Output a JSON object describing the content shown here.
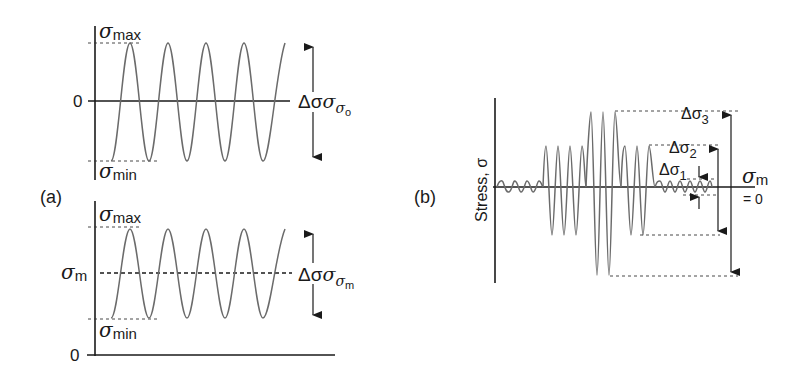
{
  "figure": {
    "panel_a": {
      "label": "(a)",
      "top": {
        "sigma": "σ",
        "max_sub": "max",
        "min_sub": "min",
        "zero_label": "0",
        "range_delta": "Δσ",
        "range_sub_sigma": "σ",
        "range_sub_sub": "o",
        "description": "Fully reversed cycle about zero"
      },
      "bottom": {
        "sigma": "σ",
        "max_sub": "max",
        "min_sub": "min",
        "mean_sub": "m",
        "zero_label": "0",
        "range_delta": "Δσ",
        "range_sub_sigma": "σ",
        "range_sub_sub": "m",
        "description": "Cycle about nonzero mean stress"
      }
    },
    "panel_b": {
      "label": "(b)",
      "y_axis_label": "Stress, σ",
      "mean_sigma": "σ",
      "mean_sub": "m",
      "mean_value": "= 0",
      "ranges": [
        {
          "delta": "Δσ",
          "sub": "1"
        },
        {
          "delta": "Δσ",
          "sub": "2"
        },
        {
          "delta": "Δσ",
          "sub": "3"
        }
      ],
      "description": "Variable amplitude loading blocks"
    }
  },
  "colors": {
    "axis": "#1a1a1a",
    "wave": "#6b6b6b",
    "background": "#ffffff"
  }
}
